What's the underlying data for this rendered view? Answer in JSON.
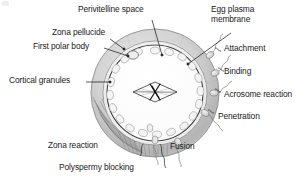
{
  "figure": {
    "kind": "biological-diagram"
  },
  "labels": {
    "perivitelline_space": "Perivitelline space",
    "egg_plasma_membrane_line1": "Egg plasma",
    "egg_plasma_membrane_line2": "membrane",
    "zona_pellucide": "Zona pellucide",
    "first_polar_body": "First polar body",
    "attachment": "Attachment",
    "binding": "Binding",
    "cortical_granules": "Cortical granules",
    "acrosome_reaction": "Acrosome reaction",
    "penetration": "Penetration",
    "fusion": "Fusion",
    "zona_reaction": "Zona reaction",
    "polyspermy_blocking": "Polyspermy blocking"
  },
  "structures": {
    "zona_pellucida": "outer shaded ring",
    "egg_plasma_membrane": "inner dark circle",
    "perivitelline_space": "gap between membrane and zona",
    "cortical_granules": "ring of small oval granules beneath membrane",
    "first_polar_body": "small body at upper-left inside zona",
    "meiotic_spindle": "spindle with chromosomes at centre",
    "zona_reaction_hatching": "dense hatched sector at lower-left of zona",
    "sperm_count_right": 4,
    "sperm_count_bottom": 3
  },
  "colors": {
    "text": "#1b1b1b",
    "zona_outer": "#bdbdbd",
    "zona_inner": "#d8d8d8",
    "cytoplasm": "#fbfbfb",
    "membrane_line": "#4a4a4a",
    "granule_fill": "#f2f2f2",
    "granule_stroke": "#9a9a9a",
    "sperm_fill": "#dcdcdc",
    "leader_line": "#2a2a2a",
    "background": "#ffffff"
  },
  "geometry": {
    "center_x": 155,
    "center_y": 93,
    "zona_outer_radius": 64,
    "zona_inner_radius": 52,
    "membrane_radius": 48
  }
}
